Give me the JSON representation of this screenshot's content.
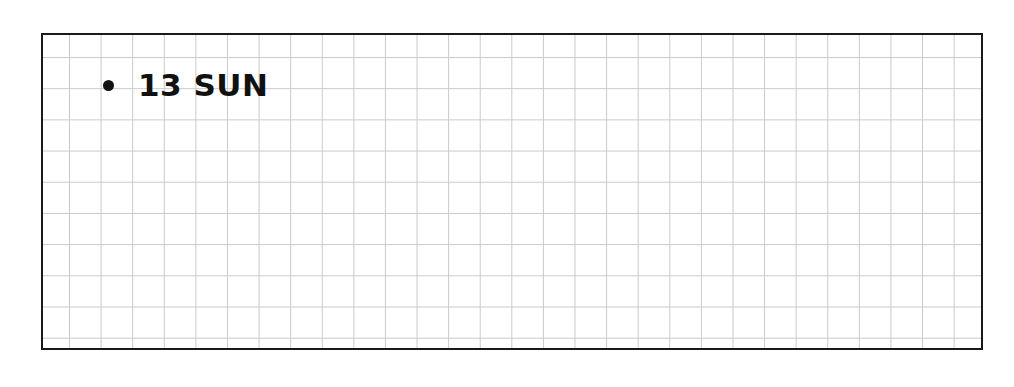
{
  "planner": {
    "entry": {
      "bullet": "•",
      "text": "13 SUN"
    },
    "grid": {
      "line_color": "#c9c9c9",
      "border_color": "#1a1a1a"
    }
  }
}
